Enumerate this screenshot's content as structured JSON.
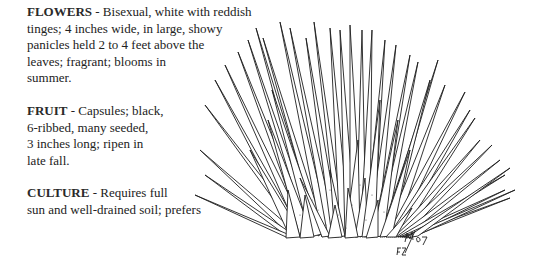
{
  "sections": [
    {
      "heading": "FLOWERS",
      "lines": [
        " - Bisexual, white with reddish",
        "tinges; 4 inches wide, in large, showy",
        "panicles held 2 to 4 feet above the",
        "leaves; fragrant; blooms in",
        "summer."
      ]
    },
    {
      "heading": "FRUIT",
      "lines": [
        " - Capsules; black,",
        "6-ribbed, many seeded,",
        "3 inches long; ripen in",
        "late fall."
      ]
    },
    {
      "heading": "CULTURE",
      "lines": [
        " - Requires full",
        "sun and well-drained soil; prefers"
      ]
    }
  ],
  "illustration": {
    "subject": "plant-rosette-drawing",
    "signature": "M/87 FZ"
  },
  "colors": {
    "ink": "#222222",
    "background": "#ffffff"
  }
}
